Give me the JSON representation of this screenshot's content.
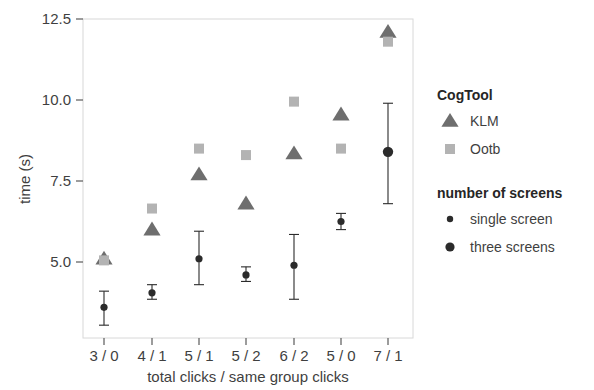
{
  "chart_data": {
    "type": "scatter",
    "title": "",
    "xlabel": "total clicks / same group clicks",
    "ylabel": "time (s)",
    "categories": [
      "3 / 0",
      "4 / 1",
      "5 / 1",
      "5 / 2",
      "6 / 2",
      "5 / 0",
      "7 / 1"
    ],
    "yticks": [
      5.0,
      7.5,
      10.0,
      12.5
    ],
    "ytick_labels": [
      "5.0",
      "7.5",
      "10.0",
      "12.5"
    ],
    "ylim": [
      2.8,
      12.75
    ],
    "grid": false,
    "legend_position": "right",
    "series": [
      {
        "name": "KLM",
        "group": "CogTool",
        "marker": "triangle",
        "color": "#6e6e6e",
        "values": [
          5.1,
          6.0,
          7.7,
          6.8,
          8.35,
          9.55,
          12.1
        ]
      },
      {
        "name": "Ootb",
        "group": "CogTool",
        "marker": "square",
        "color": "#b3b3b3",
        "values": [
          5.05,
          6.65,
          8.5,
          8.3,
          9.95,
          8.5,
          11.8
        ]
      },
      {
        "name": "single screen",
        "group": "number of screens",
        "marker": "small-circle",
        "color": "#2b2b2b",
        "values": [
          3.6,
          4.05,
          5.1,
          4.6,
          4.9,
          6.25,
          null
        ],
        "err_low": [
          3.05,
          3.85,
          4.3,
          4.4,
          3.85,
          6.0,
          null
        ],
        "err_high": [
          4.1,
          4.3,
          5.95,
          4.85,
          5.85,
          6.5,
          null
        ]
      },
      {
        "name": "three screens",
        "group": "number of screens",
        "marker": "large-circle",
        "color": "#2b2b2b",
        "values": [
          null,
          null,
          null,
          null,
          null,
          null,
          8.4
        ],
        "err_low": [
          null,
          null,
          null,
          null,
          null,
          null,
          6.8
        ],
        "err_high": [
          null,
          null,
          null,
          null,
          null,
          null,
          9.9
        ]
      }
    ]
  },
  "legend": {
    "groups": [
      {
        "title": "CogTool",
        "entries": [
          {
            "label": "KLM",
            "marker": "triangle",
            "color": "#6e6e6e"
          },
          {
            "label": "Ootb",
            "marker": "square",
            "color": "#b3b3b3"
          }
        ]
      },
      {
        "title": "number of screens",
        "entries": [
          {
            "label": "single screen",
            "marker": "small-circle",
            "color": "#2b2b2b"
          },
          {
            "label": "three screens",
            "marker": "large-circle",
            "color": "#2b2b2b"
          }
        ]
      }
    ]
  },
  "axes": {
    "y_title": "time (s)",
    "x_title": "total clicks / same group clicks",
    "y_tick_0": "5.0",
    "y_tick_1": "7.5",
    "y_tick_2": "10.0",
    "y_tick_3": "12.5",
    "x_tick_0": "3 / 0",
    "x_tick_1": "4 / 1",
    "x_tick_2": "5 / 1",
    "x_tick_3": "5 / 2",
    "x_tick_4": "6 / 2",
    "x_tick_5": "5 / 0",
    "x_tick_6": "7 / 1"
  },
  "colors": {
    "panel_border": "#d8d8d8",
    "axis_text": "#3f3f3f",
    "klm": "#6e6e6e",
    "ootb": "#b3b3b3",
    "screens": "#2b2b2b"
  }
}
